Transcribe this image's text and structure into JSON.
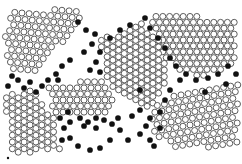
{
  "figure": {
    "colors": {
      "background": "#ffffff",
      "open_stroke": "#4a4a4a",
      "open_fill": "#ffffff",
      "filled": "#111111"
    },
    "atom_radius": 3.0,
    "grains": [
      {
        "name": "top-left-grain",
        "cx": 30,
        "cy": 45,
        "angle": -55,
        "spacing": 7.2,
        "poly": [
          [
            8,
            12
          ],
          [
            75,
            8
          ],
          [
            85,
            20
          ],
          [
            60,
            45
          ],
          [
            45,
            60
          ],
          [
            40,
            75
          ],
          [
            10,
            75
          ],
          [
            5,
            40
          ]
        ]
      },
      {
        "name": "top-right-grain",
        "cx": 190,
        "cy": 40,
        "angle": 0,
        "spacing": 6.8,
        "poly": [
          [
            150,
            14
          ],
          [
            235,
            18
          ],
          [
            238,
            60
          ],
          [
            205,
            78
          ],
          [
            175,
            70
          ],
          [
            155,
            45
          ]
        ]
      },
      {
        "name": "center-grain",
        "cx": 130,
        "cy": 70,
        "angle": 30,
        "spacing": 6.6,
        "poly": [
          [
            100,
            40
          ],
          [
            140,
            22
          ],
          [
            160,
            40
          ],
          [
            170,
            80
          ],
          [
            150,
            110
          ],
          [
            125,
            100
          ],
          [
            105,
            80
          ]
        ]
      },
      {
        "name": "middle-left-grain",
        "cx": 70,
        "cy": 100,
        "angle": 0,
        "spacing": 7.0,
        "poly": [
          [
            45,
            85
          ],
          [
            100,
            80
          ],
          [
            115,
            90
          ],
          [
            110,
            115
          ],
          [
            55,
            115
          ]
        ]
      },
      {
        "name": "bottom-left-grain",
        "cx": 30,
        "cy": 125,
        "angle": -30,
        "spacing": 6.8,
        "poly": [
          [
            5,
            95
          ],
          [
            35,
            88
          ],
          [
            55,
            120
          ],
          [
            60,
            150
          ],
          [
            10,
            155
          ]
        ]
      },
      {
        "name": "bottom-right-grain",
        "cx": 190,
        "cy": 125,
        "angle": -10,
        "spacing": 7.2,
        "poly": [
          [
            150,
            105
          ],
          [
            200,
            85
          ],
          [
            238,
            82
          ],
          [
            238,
            145
          ],
          [
            180,
            150
          ],
          [
            155,
            135
          ]
        ]
      }
    ],
    "boundary_atoms": [
      [
        78,
        22
      ],
      [
        86,
        30
      ],
      [
        95,
        34
      ],
      [
        92,
        44
      ],
      [
        100,
        52
      ],
      [
        84,
        52
      ],
      [
        70,
        60
      ],
      [
        62,
        66
      ],
      [
        56,
        74
      ],
      [
        48,
        80
      ],
      [
        96,
        62
      ],
      [
        90,
        70
      ],
      [
        100,
        72
      ],
      [
        110,
        38
      ],
      [
        120,
        30
      ],
      [
        130,
        25
      ],
      [
        145,
        18
      ],
      [
        150,
        28
      ],
      [
        158,
        38
      ],
      [
        165,
        48
      ],
      [
        170,
        58
      ],
      [
        176,
        66
      ],
      [
        186,
        74
      ],
      [
        196,
        80
      ],
      [
        208,
        78
      ],
      [
        218,
        74
      ],
      [
        228,
        66
      ],
      [
        236,
        74
      ],
      [
        170,
        90
      ],
      [
        165,
        100
      ],
      [
        160,
        112
      ],
      [
        150,
        118
      ],
      [
        140,
        110
      ],
      [
        132,
        116
      ],
      [
        118,
        118
      ],
      [
        112,
        124
      ],
      [
        104,
        120
      ],
      [
        96,
        118
      ],
      [
        88,
        122
      ],
      [
        80,
        118
      ],
      [
        70,
        122
      ],
      [
        64,
        128
      ],
      [
        62,
        140
      ],
      [
        70,
        138
      ],
      [
        78,
        146
      ],
      [
        90,
        150
      ],
      [
        100,
        148
      ],
      [
        110,
        140
      ],
      [
        120,
        130
      ],
      [
        128,
        140
      ],
      [
        140,
        134
      ],
      [
        150,
        140
      ],
      [
        160,
        128
      ],
      [
        42,
        86
      ],
      [
        36,
        92
      ],
      [
        30,
        82
      ],
      [
        18,
        80
      ],
      [
        8,
        86
      ],
      [
        58,
        80
      ],
      [
        140,
        90
      ],
      [
        180,
        80
      ],
      [
        205,
        92
      ],
      [
        226,
        84
      ],
      [
        12,
        76
      ],
      [
        24,
        88
      ],
      [
        60,
        118
      ],
      [
        68,
        112
      ],
      [
        84,
        126
      ],
      [
        96,
        128
      ],
      [
        146,
        126
      ],
      [
        154,
        146
      ]
    ],
    "marker": {
      "x": 8,
      "y": 158,
      "r": 1.2
    }
  }
}
